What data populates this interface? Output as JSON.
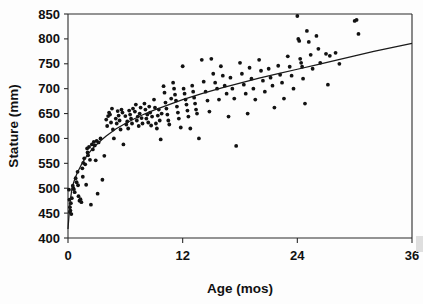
{
  "chart_data": {
    "type": "scatter",
    "title": "",
    "xlabel": "Age (mos)",
    "ylabel": "Stature (mm)",
    "xlim": [
      0,
      36
    ],
    "ylim": [
      400,
      850
    ],
    "xticks": [
      0,
      12,
      24,
      36
    ],
    "xtick_labels": [
      "0",
      "12",
      "24",
      "36"
    ],
    "yticks": [
      400,
      450,
      500,
      550,
      600,
      650,
      700,
      750,
      800,
      850
    ],
    "ytick_labels": [
      "400",
      "450",
      "500",
      "550",
      "600",
      "650",
      "700",
      "750",
      "800",
      "850"
    ],
    "grid": false,
    "legend": null,
    "marker": "filled-circle",
    "marker_color": "#121212",
    "series": [
      {
        "name": "Infant stature observations",
        "points": [
          [
            0.1,
            497
          ],
          [
            0.15,
            477
          ],
          [
            0.2,
            462
          ],
          [
            0.2,
            452
          ],
          [
            0.25,
            455
          ],
          [
            0.3,
            470
          ],
          [
            0.35,
            448
          ],
          [
            0.4,
            480
          ],
          [
            0.5,
            505
          ],
          [
            0.55,
            500
          ],
          [
            0.6,
            498
          ],
          [
            0.7,
            492
          ],
          [
            0.8,
            520
          ],
          [
            0.9,
            512
          ],
          [
            1.0,
            533
          ],
          [
            1.05,
            506
          ],
          [
            1.1,
            484
          ],
          [
            1.2,
            475
          ],
          [
            1.3,
            478
          ],
          [
            1.4,
            472
          ],
          [
            1.5,
            540
          ],
          [
            1.55,
            523
          ],
          [
            1.6,
            551
          ],
          [
            1.7,
            560
          ],
          [
            1.8,
            548
          ],
          [
            1.9,
            507
          ],
          [
            2.0,
            580
          ],
          [
            2.05,
            572
          ],
          [
            2.1,
            566
          ],
          [
            2.2,
            583
          ],
          [
            2.3,
            557
          ],
          [
            2.4,
            467
          ],
          [
            2.5,
            588
          ],
          [
            2.6,
            578
          ],
          [
            2.7,
            593
          ],
          [
            2.8,
            586
          ],
          [
            2.9,
            556
          ],
          [
            3.0,
            595
          ],
          [
            3.1,
            489
          ],
          [
            3.2,
            592
          ],
          [
            3.4,
            600
          ],
          [
            3.6,
            517
          ],
          [
            3.8,
            565
          ],
          [
            4.0,
            638
          ],
          [
            4.1,
            625
          ],
          [
            4.2,
            645
          ],
          [
            4.3,
            652
          ],
          [
            4.4,
            648
          ],
          [
            4.5,
            632
          ],
          [
            4.6,
            660
          ],
          [
            4.7,
            618
          ],
          [
            4.8,
            600
          ],
          [
            5.0,
            640
          ],
          [
            5.1,
            630
          ],
          [
            5.2,
            655
          ],
          [
            5.3,
            646
          ],
          [
            5.4,
            636
          ],
          [
            5.5,
            618
          ],
          [
            5.6,
            658
          ],
          [
            5.7,
            652
          ],
          [
            5.8,
            588
          ],
          [
            6.0,
            645
          ],
          [
            6.1,
            628
          ],
          [
            6.2,
            634
          ],
          [
            6.3,
            620
          ],
          [
            6.4,
            656
          ],
          [
            6.5,
            648
          ],
          [
            6.6,
            640
          ],
          [
            6.7,
            630
          ],
          [
            6.8,
            660
          ],
          [
            7.0,
            654
          ],
          [
            7.1,
            668
          ],
          [
            7.2,
            636
          ],
          [
            7.3,
            644
          ],
          [
            7.4,
            625
          ],
          [
            7.5,
            650
          ],
          [
            7.6,
            662
          ],
          [
            7.7,
            641
          ],
          [
            7.8,
            630
          ],
          [
            8.0,
            670
          ],
          [
            8.1,
            658
          ],
          [
            8.2,
            640
          ],
          [
            8.3,
            648
          ],
          [
            8.4,
            632
          ],
          [
            8.5,
            664
          ],
          [
            8.6,
            652
          ],
          [
            8.7,
            626
          ],
          [
            8.8,
            644
          ],
          [
            9.0,
            678
          ],
          [
            9.1,
            662
          ],
          [
            9.2,
            630
          ],
          [
            9.3,
            620
          ],
          [
            9.4,
            646
          ],
          [
            9.5,
            658
          ],
          [
            9.6,
            636
          ],
          [
            9.7,
            598
          ],
          [
            9.8,
            650
          ],
          [
            10.0,
            705
          ],
          [
            10.1,
            692
          ],
          [
            10.2,
            672
          ],
          [
            10.3,
            660
          ],
          [
            10.4,
            648
          ],
          [
            10.5,
            636
          ],
          [
            10.6,
            628
          ],
          [
            10.8,
            680
          ],
          [
            11.0,
            712
          ],
          [
            11.1,
            700
          ],
          [
            11.2,
            688
          ],
          [
            11.3,
            676
          ],
          [
            11.4,
            664
          ],
          [
            11.5,
            652
          ],
          [
            11.6,
            640
          ],
          [
            11.8,
            622
          ],
          [
            12.0,
            745
          ],
          [
            12.1,
            700
          ],
          [
            12.2,
            690
          ],
          [
            12.3,
            678
          ],
          [
            12.4,
            668
          ],
          [
            12.5,
            656
          ],
          [
            12.6,
            644
          ],
          [
            12.8,
            620
          ],
          [
            13.0,
            706
          ],
          [
            13.1,
            694
          ],
          [
            13.2,
            682
          ],
          [
            13.3,
            670
          ],
          [
            13.4,
            658
          ],
          [
            13.5,
            650
          ],
          [
            13.7,
            600
          ],
          [
            14.0,
            758
          ],
          [
            14.2,
            714
          ],
          [
            14.4,
            694
          ],
          [
            14.6,
            676
          ],
          [
            14.8,
            654
          ],
          [
            15.0,
            760
          ],
          [
            15.2,
            730
          ],
          [
            15.4,
            712
          ],
          [
            15.6,
            700
          ],
          [
            15.8,
            678
          ],
          [
            16.0,
            745
          ],
          [
            16.2,
            726
          ],
          [
            16.4,
            706
          ],
          [
            16.6,
            690
          ],
          [
            16.8,
            644
          ],
          [
            17.0,
            722
          ],
          [
            17.2,
            700
          ],
          [
            17.4,
            680
          ],
          [
            17.6,
            585
          ],
          [
            18.0,
            752
          ],
          [
            18.2,
            730
          ],
          [
            18.4,
            708
          ],
          [
            18.6,
            690
          ],
          [
            18.8,
            650
          ],
          [
            19.0,
            742
          ],
          [
            19.2,
            720
          ],
          [
            19.4,
            700
          ],
          [
            19.6,
            678
          ],
          [
            20.0,
            758
          ],
          [
            20.2,
            736
          ],
          [
            20.4,
            716
          ],
          [
            20.6,
            694
          ],
          [
            21.0,
            740
          ],
          [
            21.2,
            722
          ],
          [
            21.4,
            706
          ],
          [
            21.6,
            662
          ],
          [
            22.0,
            746
          ],
          [
            22.2,
            728
          ],
          [
            22.4,
            712
          ],
          [
            22.6,
            680
          ],
          [
            23.0,
            765
          ],
          [
            23.2,
            744
          ],
          [
            23.4,
            726
          ],
          [
            23.6,
            700
          ],
          [
            24.0,
            846
          ],
          [
            24.1,
            800
          ],
          [
            24.2,
            796
          ],
          [
            24.3,
            760
          ],
          [
            24.4,
            752
          ],
          [
            24.5,
            744
          ],
          [
            24.6,
            720
          ],
          [
            24.8,
            670
          ],
          [
            25.0,
            816
          ],
          [
            25.2,
            794
          ],
          [
            25.4,
            768
          ],
          [
            25.6,
            740
          ],
          [
            26.0,
            806
          ],
          [
            26.2,
            780
          ],
          [
            26.4,
            752
          ],
          [
            27.0,
            770
          ],
          [
            27.2,
            708
          ],
          [
            27.4,
            766
          ],
          [
            28.0,
            772
          ],
          [
            28.4,
            750
          ],
          [
            30.0,
            836
          ],
          [
            30.2,
            838
          ],
          [
            30.4,
            810
          ]
        ]
      }
    ],
    "fit_curve": {
      "name": "logarithmic growth fit",
      "description": "Smooth increasing curve through the data",
      "points": [
        [
          0.0,
          418
        ],
        [
          0.2,
          470
        ],
        [
          0.4,
          497
        ],
        [
          0.6,
          512
        ],
        [
          0.8,
          523
        ],
        [
          1.0,
          532
        ],
        [
          1.5,
          551
        ],
        [
          2.0,
          566
        ],
        [
          2.5,
          578
        ],
        [
          3.0,
          588
        ],
        [
          3.5,
          597
        ],
        [
          4.0,
          605
        ],
        [
          5.0,
          619
        ],
        [
          6.0,
          630
        ],
        [
          7.0,
          640
        ],
        [
          8.0,
          649
        ],
        [
          9.0,
          657
        ],
        [
          10.0,
          664
        ],
        [
          11.0,
          671
        ],
        [
          12.0,
          678
        ],
        [
          14.0,
          690
        ],
        [
          16.0,
          701
        ],
        [
          18.0,
          711
        ],
        [
          20.0,
          721
        ],
        [
          22.0,
          730
        ],
        [
          24.0,
          739
        ],
        [
          26.0,
          748
        ],
        [
          28.0,
          757
        ],
        [
          30.0,
          766
        ],
        [
          32.0,
          775
        ],
        [
          34.0,
          783
        ],
        [
          36.0,
          791
        ]
      ]
    }
  },
  "axes": {
    "y_title": "Stature (mm)",
    "x_title": "Age (mos)"
  }
}
